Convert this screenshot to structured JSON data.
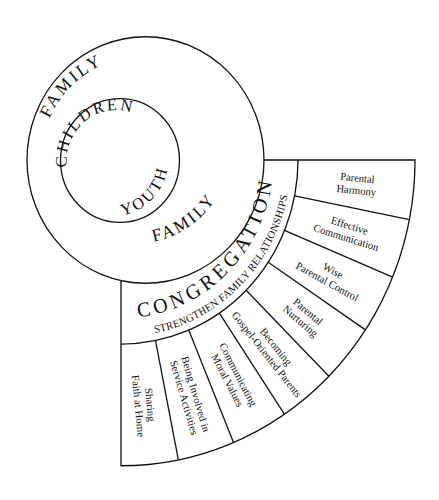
{
  "diagram": {
    "type": "nested circles with fan of segments",
    "colors": {
      "line": "#111111",
      "background": "#ffffff"
    },
    "inner_circle": {
      "labels": [
        "CHILDREN",
        "YOUTH"
      ]
    },
    "outer_ring": {
      "labels": [
        "FAMILY",
        "FAMILY"
      ]
    },
    "band": {
      "title": "CONGREGATION",
      "subtitle": "STRENGTHEN FAMILY RELATIONSHIPS"
    },
    "segments": [
      {
        "lines": [
          "Parental",
          "Harmony"
        ]
      },
      {
        "lines": [
          "Effective",
          "Communication"
        ]
      },
      {
        "lines": [
          "Wise",
          "Parental Control"
        ]
      },
      {
        "lines": [
          "Parental",
          "Nurturing"
        ]
      },
      {
        "lines": [
          "Becoming",
          "Gospel-Oriented Parents"
        ]
      },
      {
        "lines": [
          "Communicating",
          "Moral Values"
        ]
      },
      {
        "lines": [
          "Being Involved in",
          "Service Activities"
        ]
      },
      {
        "lines": [
          "Sharing",
          "Faith at Home"
        ]
      }
    ]
  }
}
